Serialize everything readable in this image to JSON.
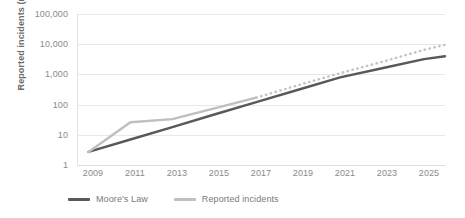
{
  "chart_data": {
    "type": "line",
    "title": "",
    "xlabel": "",
    "ylabel": "Reported incidents (millions)",
    "y_scale": "log",
    "ylim": [
      1,
      100000
    ],
    "grid": true,
    "legend_position": "bottom",
    "y_ticks": [
      "1",
      "10",
      "100",
      "1,000",
      "10,000",
      "100,000"
    ],
    "y_tick_values": [
      1,
      10,
      100,
      1000,
      10000,
      100000
    ],
    "x_ticks": [
      "2009",
      "2011",
      "2013",
      "2015",
      "2017",
      "2019",
      "2021",
      "2023",
      "2025"
    ],
    "x_tick_values": [
      2009,
      2011,
      2013,
      2015,
      2017,
      2019,
      2021,
      2023,
      2025
    ],
    "xlim": [
      2008.5,
      2026
    ],
    "series": [
      {
        "name": "Moore's Law",
        "color": "#595959",
        "style": "solid",
        "x": [
          2009,
          2011,
          2013,
          2015,
          2017,
          2019,
          2021,
          2023,
          2025,
          2026
        ],
        "values": [
          2.7,
          7,
          18,
          47,
          120,
          310,
          800,
          1600,
          3200,
          4000
        ]
      },
      {
        "name": "Reported incidents",
        "color": "#bfbfbf",
        "style": "solid-then-dotted",
        "dotted_from": 2017,
        "x": [
          2009,
          2011,
          2013,
          2015,
          2017,
          2019,
          2021,
          2023,
          2025,
          2026
        ],
        "values": [
          2.7,
          26,
          33,
          75,
          170,
          440,
          1100,
          2600,
          6500,
          9500
        ]
      }
    ]
  },
  "legend": {
    "items": [
      {
        "label": "Moore's Law",
        "color": "#595959"
      },
      {
        "label": "Reported incidents",
        "color": "#bfbfbf"
      }
    ]
  }
}
